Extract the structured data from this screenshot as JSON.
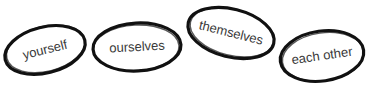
{
  "words": [
    {
      "label": "yourself",
      "cx": 45,
      "cy": 50,
      "rx": 41,
      "ry": 23,
      "rotate": -14
    },
    {
      "label": "ourselves",
      "cx": 137,
      "cy": 47,
      "rx": 44,
      "ry": 24,
      "rotate": -3
    },
    {
      "label": "themselves",
      "cx": 231,
      "cy": 33,
      "rx": 44,
      "ry": 24,
      "rotate": 14
    },
    {
      "label": "each other",
      "cx": 322,
      "cy": 56,
      "rx": 42,
      "ry": 25,
      "rotate": -8
    }
  ],
  "colors": {
    "stroke": "#111111",
    "text": "#3a3a3a",
    "background": "#ffffff"
  }
}
